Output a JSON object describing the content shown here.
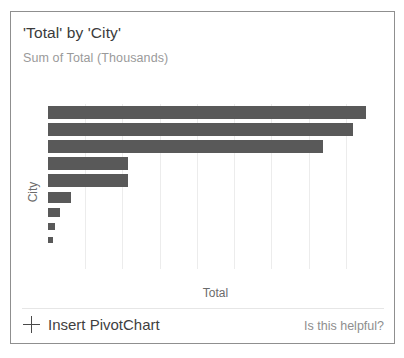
{
  "panel": {
    "title": "'Total' by 'City'",
    "subtitle": "Sum of Total (Thousands)"
  },
  "footer": {
    "insert_label": "Insert PivotChart",
    "plus_icon": "plus-icon",
    "helpful_label": "Is this helpful?"
  },
  "chart_data": {
    "type": "bar",
    "orientation": "horizontal",
    "title": "'Total' by 'City'",
    "subtitle": "Sum of Total (Thousands)",
    "xlabel": "Total",
    "ylabel": "City",
    "grid": true,
    "gridline_count": 8,
    "legend": null,
    "categories": [
      "1",
      "2",
      "3",
      "4",
      "5",
      "6",
      "7",
      "8",
      "9"
    ],
    "values": [
      95,
      91,
      82,
      24,
      24,
      7,
      3.5,
      2,
      1.5
    ],
    "xlim": [
      0,
      100
    ],
    "bar_color": "#595959",
    "gridline_color": "#ececec",
    "tick_labels": []
  }
}
